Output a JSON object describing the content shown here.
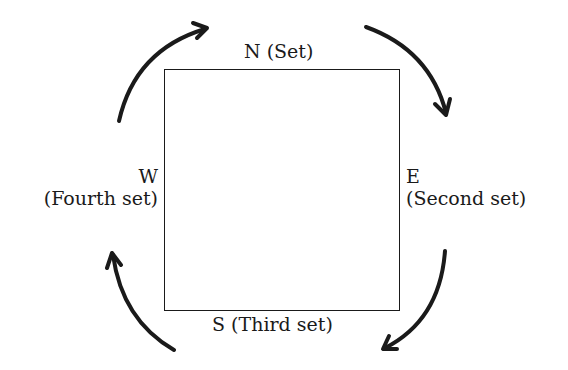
{
  "diagram": {
    "shape": "square",
    "direction": "clockwise",
    "labels": {
      "north": {
        "letter": "N",
        "text": "(Set)"
      },
      "east": {
        "letter": "E",
        "text": "(Second set)"
      },
      "south": {
        "letter": "S",
        "text": "(Third set)"
      },
      "west": {
        "letter": "W",
        "text": "(Fourth set)"
      }
    },
    "arrows": [
      {
        "name": "west-to-north",
        "from": "W",
        "to": "N"
      },
      {
        "name": "north-to-east",
        "from": "N",
        "to": "E"
      },
      {
        "name": "east-to-south",
        "from": "E",
        "to": "S"
      },
      {
        "name": "south-to-west",
        "from": "S",
        "to": "W"
      }
    ],
    "colors": {
      "stroke": "#1a1a1a",
      "background": "#ffffff"
    }
  }
}
